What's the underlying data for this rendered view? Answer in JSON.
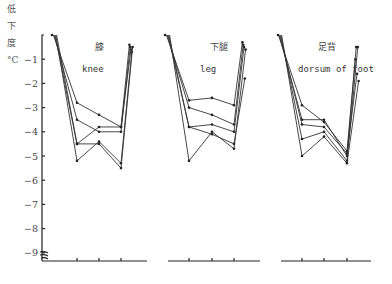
{
  "chart_data": {
    "type": "line",
    "title": "",
    "ylabel": "低下度 °C",
    "ylabel_chars": [
      "低",
      "下",
      "度",
      "°C"
    ],
    "yticks": [
      -1,
      -2,
      -3,
      -4,
      -5,
      -6,
      -7,
      -8,
      -9
    ],
    "ytick_labels": [
      "−1",
      "−2",
      "−3",
      "−4",
      "−5",
      "−6",
      "−7",
      "−8",
      "−9"
    ],
    "ylim": [
      -9.3,
      0
    ],
    "y_axis_break": true,
    "grid": false,
    "x_positions": [
      "start",
      "t1",
      "t2",
      "t3",
      "end"
    ],
    "panels": [
      {
        "name_cn": "膝",
        "name_en": "knee",
        "series": [
          {
            "values": [
              0,
              -2.8,
              -3.3,
              -3.8,
              -0.4
            ]
          },
          {
            "values": [
              0,
              -3.5,
              -4.0,
              -4.0,
              -0.5
            ]
          },
          {
            "values": [
              0,
              -4.5,
              -3.8,
              -3.8,
              -0.6
            ]
          },
          {
            "values": [
              0,
              -5.2,
              -4.4,
              -5.3,
              -0.7
            ]
          },
          {
            "values": [
              0,
              -4.5,
              -4.5,
              -5.5,
              -0.5
            ]
          }
        ]
      },
      {
        "name_cn": "下腿",
        "name_en": "leg",
        "series": [
          {
            "values": [
              0,
              -2.7,
              -2.6,
              -2.9,
              -0.3
            ]
          },
          {
            "values": [
              0,
              -3.0,
              -3.3,
              -3.7,
              -0.4
            ]
          },
          {
            "values": [
              0,
              -3.8,
              -3.7,
              -4.0,
              -0.5
            ]
          },
          {
            "values": [
              0,
              -3.8,
              -4.1,
              -4.5,
              -1.8
            ]
          },
          {
            "values": [
              0,
              -5.2,
              -4.0,
              -4.7,
              -0.6
            ]
          }
        ]
      },
      {
        "name_cn": "足背",
        "name_en": "dorsum of foot",
        "series": [
          {
            "values": [
              0,
              -2.9,
              -3.6,
              -4.8,
              -1.0
            ]
          },
          {
            "values": [
              0,
              -3.5,
              -3.5,
              -5.0,
              -0.5
            ]
          },
          {
            "values": [
              0,
              -3.7,
              -3.8,
              -4.9,
              -1.6
            ]
          },
          {
            "values": [
              0,
              -4.3,
              -4.0,
              -5.2,
              -0.5
            ]
          },
          {
            "values": [
              0,
              -5.0,
              -4.2,
              -5.3,
              -1.9
            ]
          }
        ]
      }
    ]
  }
}
